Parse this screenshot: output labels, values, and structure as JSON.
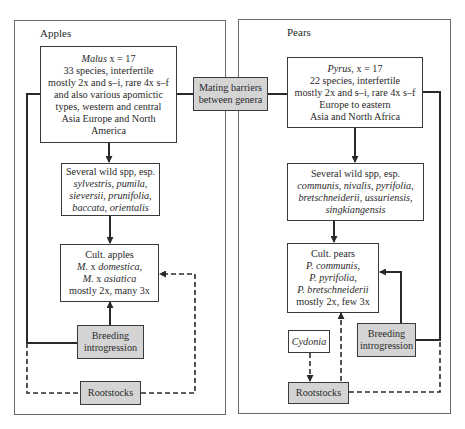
{
  "apples": {
    "title": "Apples",
    "genus_box": {
      "lines": [
        {
          "italic": "Malus",
          "rest": " x = 17"
        },
        {
          "text": "33 species, interfertile"
        },
        {
          "text": "mostly 2x and s–i, rare 4x s–f"
        },
        {
          "text": "and also various apomictic"
        },
        {
          "text": "types, western and central"
        },
        {
          "text": "Asia Europe and North"
        },
        {
          "text": "America"
        }
      ]
    },
    "wild_box": {
      "line1": "Several wild spp, esp.",
      "line2": "sylvestris, pumila,",
      "line3": "sieversii, prunifolia,",
      "line4": "baccata, orientalis"
    },
    "cult_box": {
      "line1": "Cult. apples",
      "line2_a": "M.",
      "line2_b": " x ",
      "line2_c": "domestica,",
      "line3_a": "M.",
      "line3_b": " x ",
      "line3_c": "asiatica",
      "line4": "mostly 2x, many 3x"
    },
    "breeding_box": {
      "line1": "Breeding",
      "line2": "introgression"
    },
    "rootstocks_box": {
      "label": "Rootstocks"
    }
  },
  "mating_barriers": {
    "line1": "Mating barriers",
    "line2": "between genera"
  },
  "pears": {
    "title": "Pears",
    "genus_box": {
      "line1_italic": "Pyrus",
      "line1_rest": ", x = 17",
      "line2": "22 species, interfertile",
      "line3": "mostly 2x and s–i, rare 4x s–f",
      "line4": "Europe to eastern",
      "line5": "Asia and North Africa"
    },
    "wild_box": {
      "line1": "Several wild spp, esp.",
      "line2": "communis, nivalis, pyrifolia,",
      "line3": "bretschneiderii, ussuriensis,",
      "line4": "singkiangensis"
    },
    "cult_box": {
      "line1": "Cult. pears",
      "line2": "P. communis,",
      "line3": "P. pyrifolia,",
      "line4": "P. bretschneiderii",
      "line5": "mostly 2x, few 3x"
    },
    "cydonia_box": {
      "label": "Cydonia"
    },
    "breeding_box": {
      "line1": "Breeding",
      "line2": "introgression"
    },
    "rootstocks_box": {
      "label": "Rootstocks"
    }
  },
  "colors": {
    "line": "#2a2a2a",
    "gray_fill": "#d4d4d4",
    "frame": "#6a6a6a"
  }
}
